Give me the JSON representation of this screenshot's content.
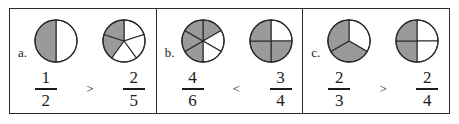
{
  "worksheet": {
    "title": "Comparing fractions with pie models",
    "stroke_color": "#2b2b2b",
    "shaded_color": "#9a9a9a",
    "unshaded_color": "#ffffff",
    "panels": [
      {
        "label": "a.",
        "operator": ">",
        "left": {
          "numerator": "1",
          "denominator": "2",
          "slices_total": 2,
          "slices_shaded": 1,
          "start_angle": 0,
          "shaded_indices": [
            1
          ],
          "figure_name": "pie-1-of-2"
        },
        "right": {
          "numerator": "2",
          "denominator": "5",
          "slices_total": 5,
          "slices_shaded": 2,
          "start_angle": 0,
          "shaded_indices": [
            3,
            4
          ],
          "figure_name": "pie-2-of-5"
        }
      },
      {
        "label": "b.",
        "operator": "<",
        "left": {
          "numerator": "4",
          "denominator": "6",
          "slices_total": 6,
          "slices_shaded": 4,
          "start_angle": 0,
          "shaded_indices": [
            0,
            3,
            4,
            5
          ],
          "figure_name": "pie-4-of-6"
        },
        "right": {
          "numerator": "3",
          "denominator": "4",
          "slices_total": 4,
          "slices_shaded": 3,
          "start_angle": 0,
          "shaded_indices": [
            1,
            2,
            3
          ],
          "figure_name": "pie-3-of-4"
        }
      },
      {
        "label": "c.",
        "operator": ">",
        "left": {
          "numerator": "2",
          "denominator": "3",
          "slices_total": 3,
          "slices_shaded": 2,
          "start_angle": 0,
          "shaded_indices": [
            1,
            2
          ],
          "figure_name": "pie-2-of-3"
        },
        "right": {
          "numerator": "2",
          "denominator": "4",
          "slices_total": 4,
          "slices_shaded": 2,
          "start_angle": 0,
          "shaded_indices": [
            2,
            3
          ],
          "figure_name": "pie-2-of-4"
        }
      }
    ]
  }
}
